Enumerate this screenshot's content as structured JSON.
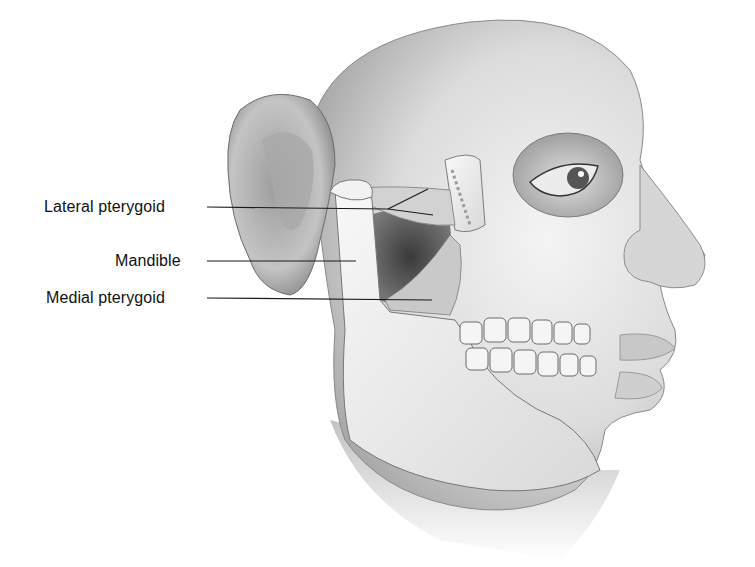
{
  "figure": {
    "labels": [
      {
        "id": "lateral-pterygoid",
        "text": "Lateral pterygoid"
      },
      {
        "id": "mandible",
        "text": "Mandible"
      },
      {
        "id": "medial-pterygoid",
        "text": "Medial pterygoid"
      }
    ]
  }
}
